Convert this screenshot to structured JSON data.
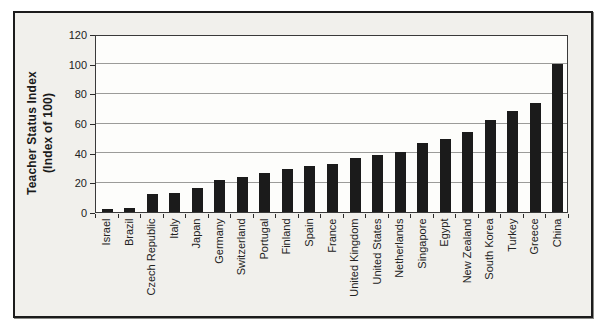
{
  "chart_data": {
    "type": "bar",
    "title": "",
    "ylabel": "Teacher Status Index (Index of 100)",
    "ylabel_line1": "Teacher Status Index",
    "ylabel_line2": "(Index of 100)",
    "xlabel": "",
    "ylim": [
      0,
      120
    ],
    "yticks": [
      0,
      20,
      40,
      60,
      80,
      100,
      120
    ],
    "grid": "horizontal",
    "legend_position": "none",
    "categories": [
      "Israel",
      "Brazil",
      "Czech Republic",
      "Italy",
      "Japan",
      "Germany",
      "Switzerland",
      "Portugal",
      "Finland",
      "Spain",
      "France",
      "United Kingdom",
      "United States",
      "Netherlands",
      "Singapore",
      "Egypt",
      "New Zealand",
      "South Korea",
      "Turkey",
      "Greece",
      "China"
    ],
    "values": [
      2.0,
      2.4,
      12.1,
      13.0,
      16.2,
      21.6,
      23.8,
      26.0,
      28.9,
      30.7,
      32.3,
      36.7,
      38.4,
      40.3,
      46.3,
      49.3,
      54.0,
      62.0,
      68.0,
      73.7,
      100.0
    ]
  },
  "colors": {
    "bar": "#1b1b1b",
    "gridline": "#9b9b99",
    "axis": "#3a3a3a",
    "frame_border": "#1c1c1c",
    "figure_background": "#f1f0ec",
    "plot_background": "#fdfdfb"
  }
}
